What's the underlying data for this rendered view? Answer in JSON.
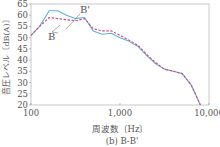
{
  "chart_data": {
    "type": "line",
    "title": "(b) B-B'",
    "xlabel": "周波数〔Hz〕",
    "ylabel": "音圧レベル〔dB(A)〕",
    "xscale": "log",
    "xlim": [
      100,
      10000
    ],
    "ylim": [
      20,
      65
    ],
    "xticks": [
      "100",
      "1,000",
      "10,000"
    ],
    "yticks": [
      "20",
      "25",
      "30",
      "35",
      "40",
      "45",
      "50",
      "55",
      "60",
      "65"
    ],
    "grid": false,
    "x": [
      100,
      125,
      160,
      200,
      250,
      315,
      400,
      500,
      630,
      800,
      1000,
      1250,
      1600,
      2000,
      2500,
      3150,
      4000,
      5000,
      6300,
      8000
    ],
    "series": [
      {
        "name": "B'",
        "color": "#5ab4e0",
        "style": "solid",
        "values": [
          51,
          55,
          62,
          62,
          60,
          58.5,
          59,
          53,
          51.5,
          52,
          50,
          48.5,
          46,
          42,
          38.5,
          36,
          35,
          34,
          29,
          20
        ]
      },
      {
        "name": "B",
        "color": "#d9487a",
        "style": "dashed",
        "values": [
          51,
          55,
          59,
          58.5,
          58,
          57.5,
          58.5,
          54,
          53,
          53,
          51,
          49,
          46.5,
          42.5,
          39,
          36,
          35,
          34,
          29,
          20
        ]
      }
    ],
    "annotations": [
      {
        "text": "B'",
        "target": "B'"
      },
      {
        "text": "B",
        "target": "B"
      }
    ]
  }
}
